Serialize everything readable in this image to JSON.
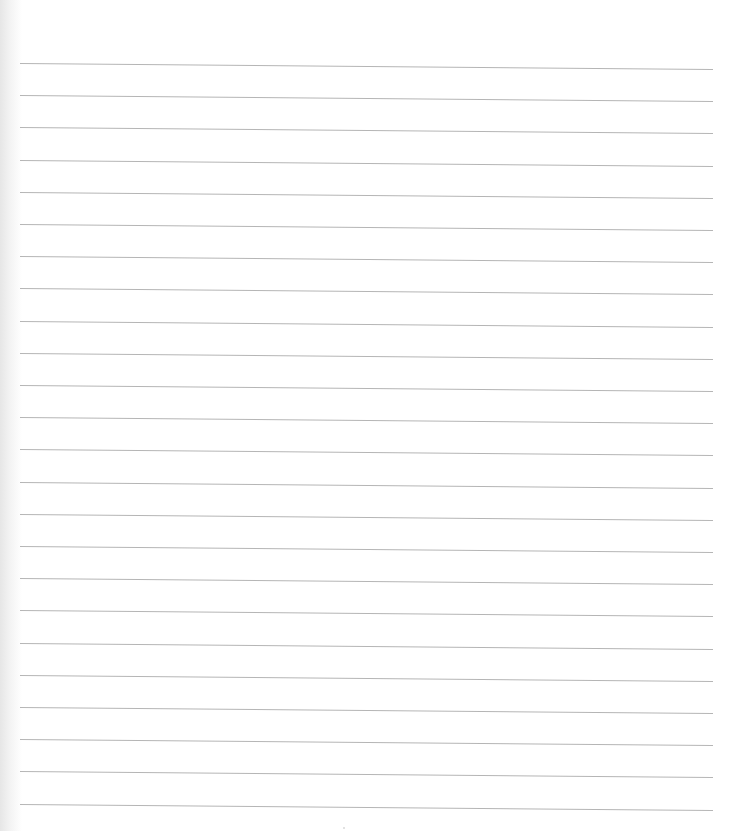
{
  "paper": {
    "type": "lined-paper",
    "line_count": 24,
    "line_color": "#b5b5b5",
    "background": "#ffffff",
    "first_line_y": 66,
    "line_spacing": 32.2
  }
}
